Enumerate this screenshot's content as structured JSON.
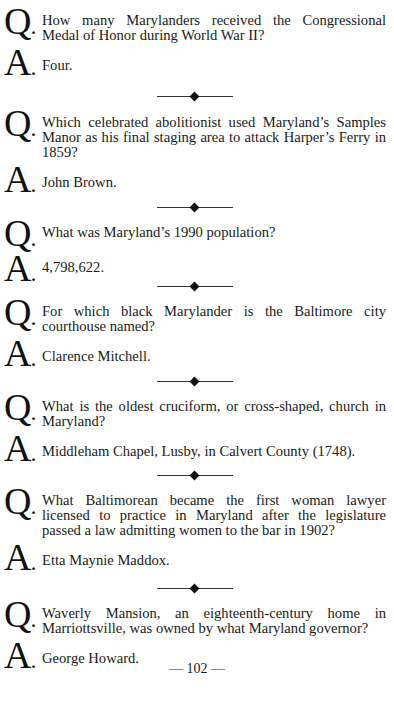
{
  "q_marker": "Q",
  "a_marker": "A",
  "items": [
    {
      "question": "How many Marylanders received the Congressional Medal of Honor during World War II?",
      "answer": "Four."
    },
    {
      "question": "Which celebrated abolitionist used Maryland’s Samples Manor as his final staging area to attack Harper’s Ferry in 1859?",
      "answer": "John Brown."
    },
    {
      "question": "What was Maryland’s 1990 population?",
      "answer": "4,798,622."
    },
    {
      "question": "For which black Marylander is the Baltimore city courthouse named?",
      "answer": "Clarence Mitchell."
    },
    {
      "question": "What is the oldest cruciform, or cross-shaped, church in Maryland?",
      "answer": "Middleham Chapel, Lusby, in Calvert County (1748)."
    },
    {
      "question": "What Baltimorean became the first woman lawyer licensed to practice in Maryland after the legislature passed a law admitting women to the bar in 1902?",
      "answer": "Etta Maynie Maddox."
    },
    {
      "question": "Waverly Mansion, an eighteenth-century home in Marriottsville, was owned by what Maryland governor?",
      "answer": "George Howard."
    }
  ],
  "page_number": "— 102 —"
}
